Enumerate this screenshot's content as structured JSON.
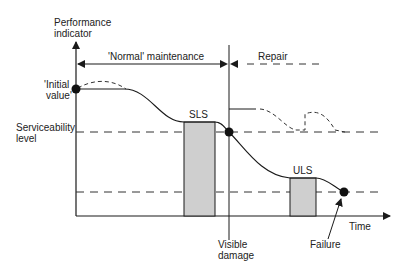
{
  "diagram": {
    "y_axis_label": [
      "Performance",
      "indicator"
    ],
    "x_axis_label": "Time",
    "initial_value_label": [
      "'Initial",
      "value'"
    ],
    "serviceability_label": [
      "Serviceability",
      "level"
    ],
    "normal_maintenance_label": "'Normal' maintenance",
    "repair_label": "Repair",
    "sls_label": "SLS",
    "uls_label": "ULS",
    "visible_damage_label": [
      "Visible",
      "damage"
    ],
    "failure_label": "Failure",
    "colors": {
      "line": "#1a1a1a",
      "box_fill": "#cfcfcf",
      "dashed": "#333333"
    }
  }
}
